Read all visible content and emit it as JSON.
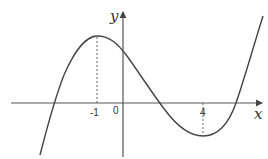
{
  "figure": {
    "type": "function-graph",
    "axes": {
      "x_label": "x",
      "y_label": "y",
      "origin_label": "0"
    },
    "ticks": {
      "x_marks": [
        "-1",
        "4"
      ]
    },
    "critical_points": [
      {
        "x": "-1",
        "kind": "local maximum"
      },
      {
        "x": "4",
        "kind": "local minimum"
      }
    ],
    "colors": {
      "curve": "#444444",
      "axes": "#555555",
      "dashed": "#555555"
    }
  }
}
